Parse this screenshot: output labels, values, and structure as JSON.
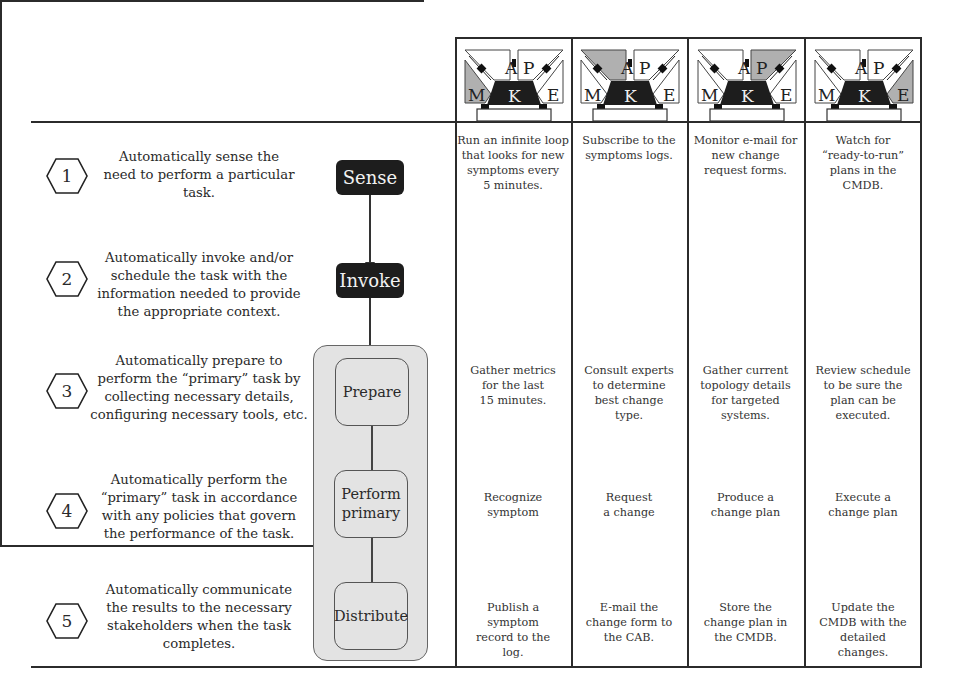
{
  "mape_icon_letters": {
    "m": "M",
    "a": "A",
    "p": "P",
    "e": "E",
    "k": "K"
  },
  "columns": [
    {
      "highlight": "M"
    },
    {
      "highlight": "A"
    },
    {
      "highlight": "P"
    },
    {
      "highlight": "E"
    }
  ],
  "steps": [
    {
      "number": "1",
      "lines": [
        "Automatically sense the",
        "need to perform a particular",
        "task."
      ],
      "process": "Sense",
      "cells": [
        [
          "Run an infinite loop",
          "that looks for new",
          "symptoms every",
          "5 minutes."
        ],
        [
          "Subscribe to the",
          "symptoms logs."
        ],
        [
          "Monitor e-mail for",
          "new change",
          "request forms."
        ],
        [
          "Watch for",
          "“ready-to-run”",
          "plans in the",
          "CMDB."
        ]
      ]
    },
    {
      "number": "2",
      "lines": [
        "Automatically invoke and/or",
        "schedule the task with the",
        "information needed to provide",
        "the appropriate context."
      ],
      "process": "Invoke",
      "cells": [
        [],
        [],
        [],
        []
      ]
    },
    {
      "number": "3",
      "lines": [
        "Automatically prepare to",
        "perform the “primary” task by",
        "collecting necessary details,",
        "configuring necessary tools, etc."
      ],
      "process": "Prepare",
      "cells": [
        [
          "Gather metrics",
          "for the last",
          "15 minutes."
        ],
        [
          "Consult experts",
          "to determine",
          "best change",
          "type."
        ],
        [
          "Gather current",
          "topology details",
          "for targeted",
          "systems."
        ],
        [
          "Review schedule",
          "to be sure the",
          "plan can be",
          "executed."
        ]
      ]
    },
    {
      "number": "4",
      "lines": [
        "Automatically  perform the",
        "“primary” task in accordance",
        "with any policies that govern",
        "the performance of the task."
      ],
      "process": "Perform primary",
      "cells": [
        [
          "Recognize",
          "symptom"
        ],
        [
          "Request",
          "a change"
        ],
        [
          "Produce a",
          "change plan"
        ],
        [
          "Execute a",
          "change plan"
        ]
      ]
    },
    {
      "number": "5",
      "lines": [
        "Automatically communicate",
        "the results to the necessary",
        "stakeholders when the task",
        "completes."
      ],
      "process": "Distribute",
      "cells": [
        [
          "Publish a",
          "symptom",
          "record to the",
          "log."
        ],
        [
          "E-mail the",
          "change form to",
          "the CAB."
        ],
        [
          "Store the",
          "change plan in",
          "the CMDB."
        ],
        [
          "Update the",
          "CMDB with the",
          "detailed",
          "changes."
        ]
      ]
    }
  ],
  "process_labels": {
    "sense": "Sense",
    "invoke": "Invoke",
    "prepare": "Prepare",
    "perform_1": "Perform",
    "perform_2": "primary",
    "distribute": "Distribute"
  },
  "colors": {
    "dark": "#1d1d1d",
    "gray_fill": "#e3e3e3",
    "highlight": "#b0b0b0",
    "border": "#2b2b2b"
  }
}
